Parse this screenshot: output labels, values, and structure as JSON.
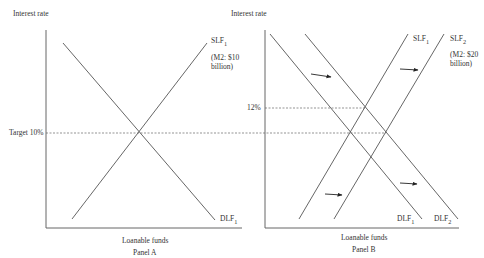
{
  "panel_a": {
    "y_axis_label": "Interest rate",
    "x_axis_label": "Loanable funds",
    "panel_title": "Panel A",
    "rate_label": "Target 10%",
    "curves": {
      "supply": {
        "name": "SLF",
        "sub": "1",
        "note_line1": "(M2: $10",
        "note_line2": "billion)"
      },
      "demand": {
        "name": "DLF",
        "sub": "1"
      }
    }
  },
  "panel_b": {
    "y_axis_label": "Interest rate",
    "x_axis_label": "Loanable funds",
    "panel_title": "Panel B",
    "rate_label": "12%",
    "curves": {
      "supply1": {
        "name": "SLF",
        "sub": "1"
      },
      "supply2": {
        "name": "SLF",
        "sub": "2",
        "note_line1": "(M2: $20",
        "note_line2": "billion)"
      },
      "demand1": {
        "name": "DLF",
        "sub": "1"
      },
      "demand2": {
        "name": "DLF",
        "sub": "2"
      }
    }
  },
  "colors": {
    "line": "#555555",
    "axis": "#666666",
    "dash": "#666666",
    "arrow": "#222222"
  }
}
